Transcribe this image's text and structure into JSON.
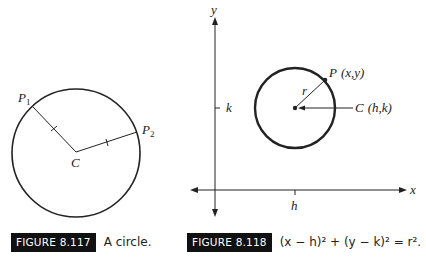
{
  "figure_117": {
    "badge": "FIGURE 8.117",
    "caption": "A circle.",
    "labels": {
      "p1": "P",
      "p1_sub": "1",
      "p2": "P",
      "p2_sub": "2",
      "center": "C"
    }
  },
  "figure_118": {
    "badge": "FIGURE 8.118",
    "caption_equation": "(x − h)² + (y − k)² = r².",
    "labels": {
      "y_axis": "y",
      "x_axis": "x",
      "k_tick": "k",
      "h_tick": "h",
      "radius": "r",
      "point": "P",
      "point_coords": "(x,y)",
      "center": "C",
      "center_coords": "(h,k)"
    }
  },
  "colors": {
    "ink": "#222222",
    "badge_bg": "#111111",
    "badge_text": "#ffffff"
  }
}
